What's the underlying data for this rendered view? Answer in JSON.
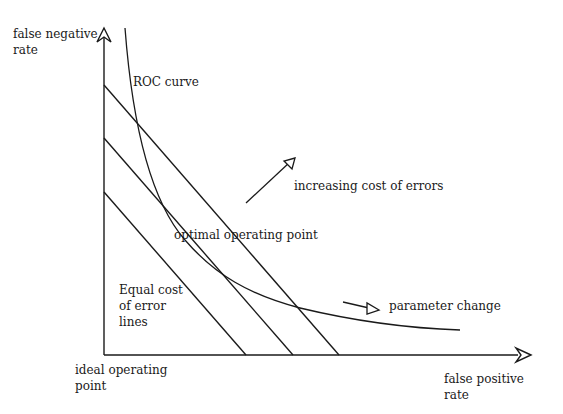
{
  "diagram": {
    "axes": {
      "y_label_line1": "false negative",
      "y_label_line2": "rate",
      "x_label_line1": "false positive",
      "x_label_line2": "rate",
      "origin_label_line1": "ideal operating",
      "origin_label_line2": "point"
    },
    "labels": {
      "roc_curve": "ROC curve",
      "increasing_cost": "increasing cost of errors",
      "optimal_point": "optimal operating point",
      "parameter_change": "parameter change",
      "equal_cost_line1": "Equal cost",
      "equal_cost_line2": "of error",
      "equal_cost_line3": "lines"
    },
    "colors": {
      "stroke": "#1a1a1a",
      "background": "#ffffff"
    }
  }
}
